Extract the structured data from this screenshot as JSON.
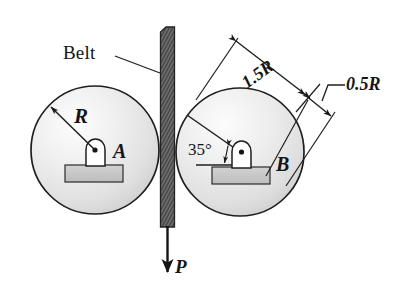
{
  "figure": {
    "background": "#ffffff",
    "ink_color": "#1a1a1a",
    "pulley_fill_light": "#fdfdfd",
    "pulley_fill_mid": "#e6e6e6",
    "pulley_fill_dark": "#c9c9c9",
    "belt_color": "#5b5b5b",
    "base_plate_color": "#c6c6c6"
  },
  "labels": {
    "belt": "Belt",
    "radius": "R",
    "pulley_a": "A",
    "pulley_b": "B",
    "force": "P",
    "angle": "35°",
    "dim_long": "1.5R",
    "dim_short": "0.5R"
  },
  "geometry": {
    "pulley_a": {
      "cx": 95,
      "cy": 150,
      "r": 64
    },
    "pulley_b": {
      "cx": 240,
      "cy": 152,
      "r": 64
    },
    "belt": {
      "x": 160,
      "y_top": 27,
      "width": 15,
      "y_bottom": 227
    },
    "force_arrow": {
      "x": 167,
      "y_from": 227,
      "y_to": 276
    },
    "angle_degrees": 35,
    "dimension_long": "1.5R",
    "dimension_short": "0.5R"
  }
}
